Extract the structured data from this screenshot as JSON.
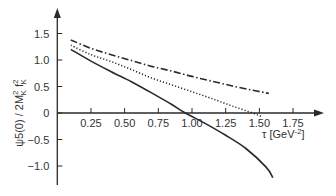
{
  "chart_data": {
    "type": "line",
    "title": "",
    "xlabel": "τ [GeV⁻²]",
    "ylabel": "ψ5(0) / 2M_K^2 f_K^2",
    "xlim": [
      0,
      1.95
    ],
    "ylim": [
      -1.4,
      1.85
    ],
    "grid": false,
    "legend": null,
    "x_ticks": [
      "0.25",
      "0.50",
      "0.75",
      "1.00",
      "1.25",
      "1.50",
      "1.75"
    ],
    "y_ticks": [
      "1.5",
      "1.0",
      "0.5",
      "0",
      "−0.5",
      "−1.0"
    ],
    "series": [
      {
        "name": "solid",
        "style": "solid",
        "x": [
          0.1,
          0.25,
          0.4,
          0.55,
          0.7,
          0.85,
          0.95,
          1.1,
          1.25,
          1.4,
          1.55,
          1.6
        ],
        "y": [
          1.2,
          0.98,
          0.78,
          0.59,
          0.38,
          0.16,
          0.0,
          -0.2,
          -0.42,
          -0.67,
          -1.02,
          -1.22
        ]
      },
      {
        "name": "dotted",
        "style": "dotted",
        "x": [
          0.1,
          0.25,
          0.4,
          0.55,
          0.7,
          0.85,
          1.0,
          1.15,
          1.3,
          1.45,
          1.52
        ],
        "y": [
          1.28,
          1.1,
          0.97,
          0.82,
          0.66,
          0.53,
          0.4,
          0.27,
          0.13,
          0.0,
          -0.07
        ]
      },
      {
        "name": "dash-dot",
        "style": "dashdot",
        "x": [
          0.1,
          0.25,
          0.4,
          0.55,
          0.7,
          0.85,
          1.0,
          1.15,
          1.3,
          1.45,
          1.57
        ],
        "y": [
          1.38,
          1.22,
          1.1,
          0.99,
          0.88,
          0.79,
          0.69,
          0.6,
          0.51,
          0.43,
          0.37
        ]
      }
    ]
  },
  "labels": {
    "ylabel": "ψ5(0) / 2M",
    "ylabel_sub": "K",
    "ylabel_sup": "2",
    "ylabel_f": " f",
    "ylabel_f_sub": "K",
    "ylabel_f_sup": "2",
    "xlabel_main": "τ [GeV",
    "xlabel_sup": "-2",
    "xlabel_close": "]"
  }
}
